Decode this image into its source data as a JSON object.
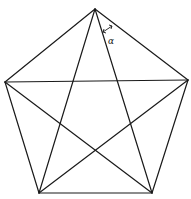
{
  "figure": {
    "vertices": {
      "top": [
        95,
        9
      ],
      "right": [
        188,
        80
      ],
      "bottom_right": [
        152,
        193
      ],
      "bottom_left": [
        39,
        193
      ],
      "left": [
        5,
        82
      ]
    },
    "angle_label": {
      "text": "α",
      "arrow": "double-headed",
      "position": [
        106,
        40
      ]
    }
  }
}
